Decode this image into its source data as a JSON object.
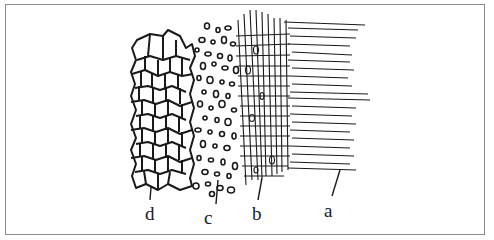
{
  "figure": {
    "labels": [
      {
        "key": "d",
        "text": "d",
        "region": "polygonal cell network (left)"
      },
      {
        "key": "c",
        "text": "c",
        "region": "scattered small oval granules"
      },
      {
        "key": "b",
        "text": "b",
        "region": "cross-hatched grid"
      },
      {
        "key": "a",
        "text": "a",
        "region": "parallel radiating fibers (right)"
      }
    ],
    "colors": {
      "ink": "#1a1a1a",
      "frame": "#8a8a8a",
      "background": "#ffffff"
    }
  }
}
